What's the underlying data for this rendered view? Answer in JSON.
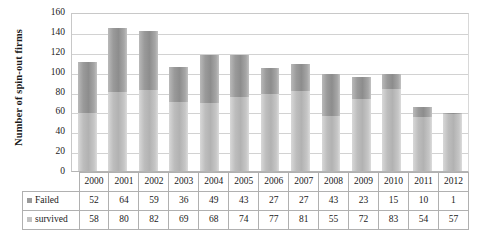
{
  "chart_data": {
    "type": "bar",
    "subtype": "stacked-column",
    "title": "",
    "xlabel": "",
    "ylabel": "Number of spin-out firms",
    "ylim": [
      0,
      160
    ],
    "ytick_step": 20,
    "yticks": [
      160,
      140,
      120,
      100,
      80,
      60,
      40,
      20,
      0
    ],
    "grid": true,
    "legend_position": "data-table",
    "categories": [
      "2000",
      "2001",
      "2002",
      "2003",
      "2004",
      "2005",
      "2006",
      "2007",
      "2008",
      "2009",
      "2010",
      "2011",
      "2012"
    ],
    "series": [
      {
        "name": "Failed",
        "values": [
          52,
          64,
          59,
          36,
          49,
          43,
          27,
          27,
          43,
          23,
          15,
          10,
          1
        ],
        "color": "#9a9a9a",
        "stack_position": "top"
      },
      {
        "name": "survived",
        "values": [
          58,
          80,
          82,
          69,
          68,
          74,
          77,
          81,
          55,
          72,
          83,
          54,
          57
        ],
        "color": "#c2c2c2",
        "stack_position": "bottom"
      }
    ],
    "totals": [
      110,
      144,
      141,
      105,
      117,
      117,
      104,
      108,
      98,
      95,
      98,
      64,
      58
    ]
  },
  "table": {
    "row_labels": [
      "Failed",
      "survived"
    ],
    "header": [
      "2000",
      "2001",
      "2002",
      "2003",
      "2004",
      "2005",
      "2006",
      "2007",
      "2008",
      "2009",
      "2010",
      "2011",
      "2012"
    ],
    "rows": [
      [
        "52",
        "64",
        "59",
        "36",
        "49",
        "43",
        "27",
        "27",
        "43",
        "23",
        "15",
        "10",
        "1"
      ],
      [
        "58",
        "80",
        "82",
        "69",
        "68",
        "74",
        "77",
        "81",
        "55",
        "72",
        "83",
        "54",
        "57"
      ]
    ]
  },
  "colors": {
    "failed": "#9a9a9a",
    "survived": "#c2c2c2",
    "gridline": "#d2d2d2",
    "border": "#b0b0b0"
  }
}
